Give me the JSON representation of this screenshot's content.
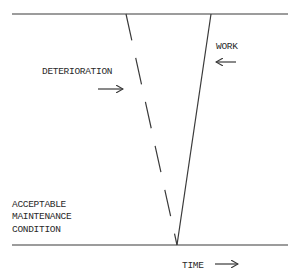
{
  "diagram": {
    "type": "maintenance-cycle",
    "labels": {
      "deterioration": "DETERIORATION",
      "work": "WORK",
      "acceptable_line1": "ACCEPTABLE",
      "acceptable_line2": "MAINTENANCE",
      "acceptable_line3": "CONDITION",
      "time": "TIME"
    },
    "arrows": {
      "deterioration_arrow": "right-arrow",
      "work_arrow": "left-arrow",
      "time_arrow": "right-arrow"
    },
    "lines": {
      "top_boundary": {
        "x1": 12,
        "y1": 14,
        "x2": 288,
        "y2": 14
      },
      "bottom_boundary": {
        "x1": 12,
        "y1": 245,
        "x2": 288,
        "y2": 245
      },
      "deterioration_dashed": {
        "x1": 126,
        "y1": 14,
        "x2": 177,
        "y2": 245
      },
      "work_solid": {
        "x1": 211,
        "y1": 14,
        "x2": 177,
        "y2": 245
      }
    },
    "colors": {
      "line": "#3a3a3a",
      "text": "#2a2a2a",
      "background": "#ffffff"
    }
  }
}
